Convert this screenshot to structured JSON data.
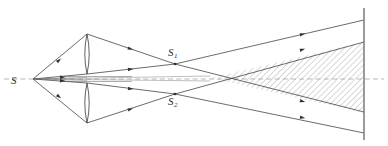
{
  "figure": {
    "type": "optics-ray-diagram",
    "background_color": "#ffffff",
    "ink_color": "#3a3a3a",
    "hatch_color": "#6d6d6d",
    "axis_color": "#8a8a8a",
    "screen_color": "#7a7a7a",
    "width": 388,
    "height": 146
  },
  "labels": {
    "source": {
      "text": "S",
      "x": 13,
      "y": 83
    },
    "image_upper": {
      "text": "S",
      "sub": "1",
      "x": 170,
      "y": 55
    },
    "image_lower": {
      "text": "S",
      "sub": "2",
      "x": 170,
      "y": 104
    }
  },
  "points": {
    "source": {
      "x": 33,
      "y": 79
    },
    "lens_top": {
      "x": 87,
      "y": 34
    },
    "lens_upper_inner": {
      "x": 87,
      "y": 74
    },
    "lens_lower_inner": {
      "x": 87,
      "y": 83
    },
    "lens_bottom": {
      "x": 87,
      "y": 123
    },
    "S1": {
      "x": 175,
      "y": 64
    },
    "S2": {
      "x": 175,
      "y": 94
    },
    "crossing": {
      "x": 210,
      "y": 78
    },
    "screen_x": 364
  },
  "elements": {
    "lens_upper": {
      "name": "upper-lens-half",
      "top": 34,
      "bottom": 74,
      "x": 87,
      "bulge": 4
    },
    "lens_lower": {
      "name": "lower-lens-half",
      "top": 83,
      "bottom": 123,
      "x": 87,
      "bulge": 4
    },
    "screen": {
      "name": "observation-screen",
      "x": 364,
      "y_top": 8,
      "y_bottom": 140
    },
    "optical_axis": {
      "name": "optical-axis",
      "y": 79,
      "x_start": 4,
      "x_end": 384,
      "dashed": true
    },
    "interference_zone": {
      "name": "hatched-interference-region",
      "hatch_angle_deg": 45,
      "hatch_spacing": 3
    }
  },
  "rays": {
    "count_from_source": 4,
    "arrow_marks": 12,
    "description": "Rays from S through two lens halves forming images S1 and S2, overlapping in hatched region up to the screen"
  }
}
